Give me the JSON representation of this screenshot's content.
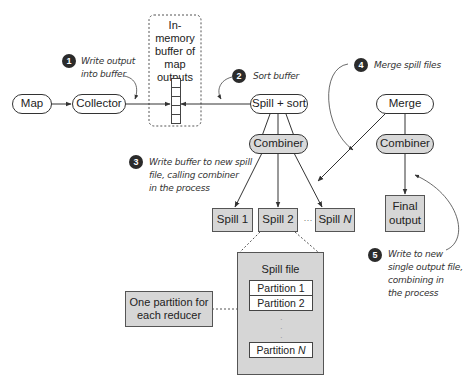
{
  "diagram": {
    "nodes": {
      "map": "Map",
      "collector": "Collector",
      "buffer_title": [
        "In-memory",
        "buffer of",
        "map",
        "outputs"
      ],
      "spill_sort": "Spill + sort",
      "combiner_left": "Combiner",
      "merge": "Merge",
      "combiner_right": "Combiner",
      "spill1": "Spill 1",
      "spill2": "Spill 2",
      "spill_ellipsis": "···",
      "spillN_prefix": "Spill ",
      "spillN_italic": "N",
      "final_output": [
        "Final",
        "output"
      ],
      "spill_file_title": "Spill file",
      "partition1": "Partition 1",
      "partition2": "Partition 2",
      "partitionN_prefix": "Partition ",
      "partitionN_italic": "N",
      "partition_note": [
        "One partition for",
        "each reducer"
      ]
    },
    "annotations": [
      {
        "number": "1",
        "lines": [
          "Write output",
          "into buffer"
        ]
      },
      {
        "number": "2",
        "lines": [
          "Sort buffer"
        ]
      },
      {
        "number": "3",
        "lines": [
          "Write buffer to new spill",
          "file, calling combiner",
          "in the process"
        ]
      },
      {
        "number": "4",
        "lines": [
          "Merge spill files"
        ]
      },
      {
        "number": "5",
        "lines": [
          "Write to new",
          "single output file,",
          "combining in",
          "the process"
        ]
      }
    ],
    "colors": {
      "node_fill_grey": "#d9d9d9",
      "doc_fill": "#d6d6d6",
      "stroke": "#333333",
      "badge": "#2b2b2b"
    }
  }
}
